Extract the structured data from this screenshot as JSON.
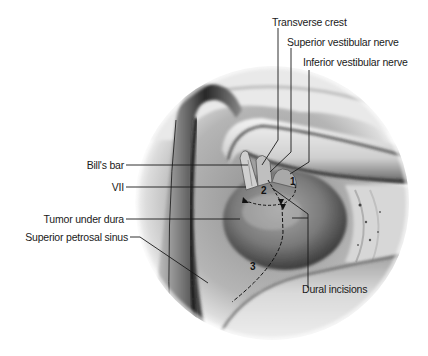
{
  "figure": {
    "type": "anatomical-illustration",
    "labels_left": [
      {
        "id": "bills-bar",
        "text": "Bill's bar"
      },
      {
        "id": "vii",
        "text": "VII"
      },
      {
        "id": "tumor-under-dura",
        "text": "Tumor under dura"
      },
      {
        "id": "superior-petrosal-sinus",
        "text": "Superior petrosal sinus"
      }
    ],
    "labels_top": [
      {
        "id": "transverse-crest",
        "text": "Transverse crest"
      },
      {
        "id": "superior-vestibular-nerve",
        "text": "Superior vestibular nerve"
      },
      {
        "id": "inferior-vestibular-nerve",
        "text": "Inferior vestibular nerve"
      }
    ],
    "labels_bottom": [
      {
        "id": "dural-incisions",
        "text": "Dural incisions"
      }
    ],
    "incision_numbers": [
      "1",
      "2",
      "3"
    ],
    "colors": {
      "background": "#ffffff",
      "line": "#1a1a1a",
      "tissue_light": "#e6e6e6",
      "tissue_mid": "#9a9a9a",
      "tissue_dark": "#3a3a3a"
    }
  }
}
